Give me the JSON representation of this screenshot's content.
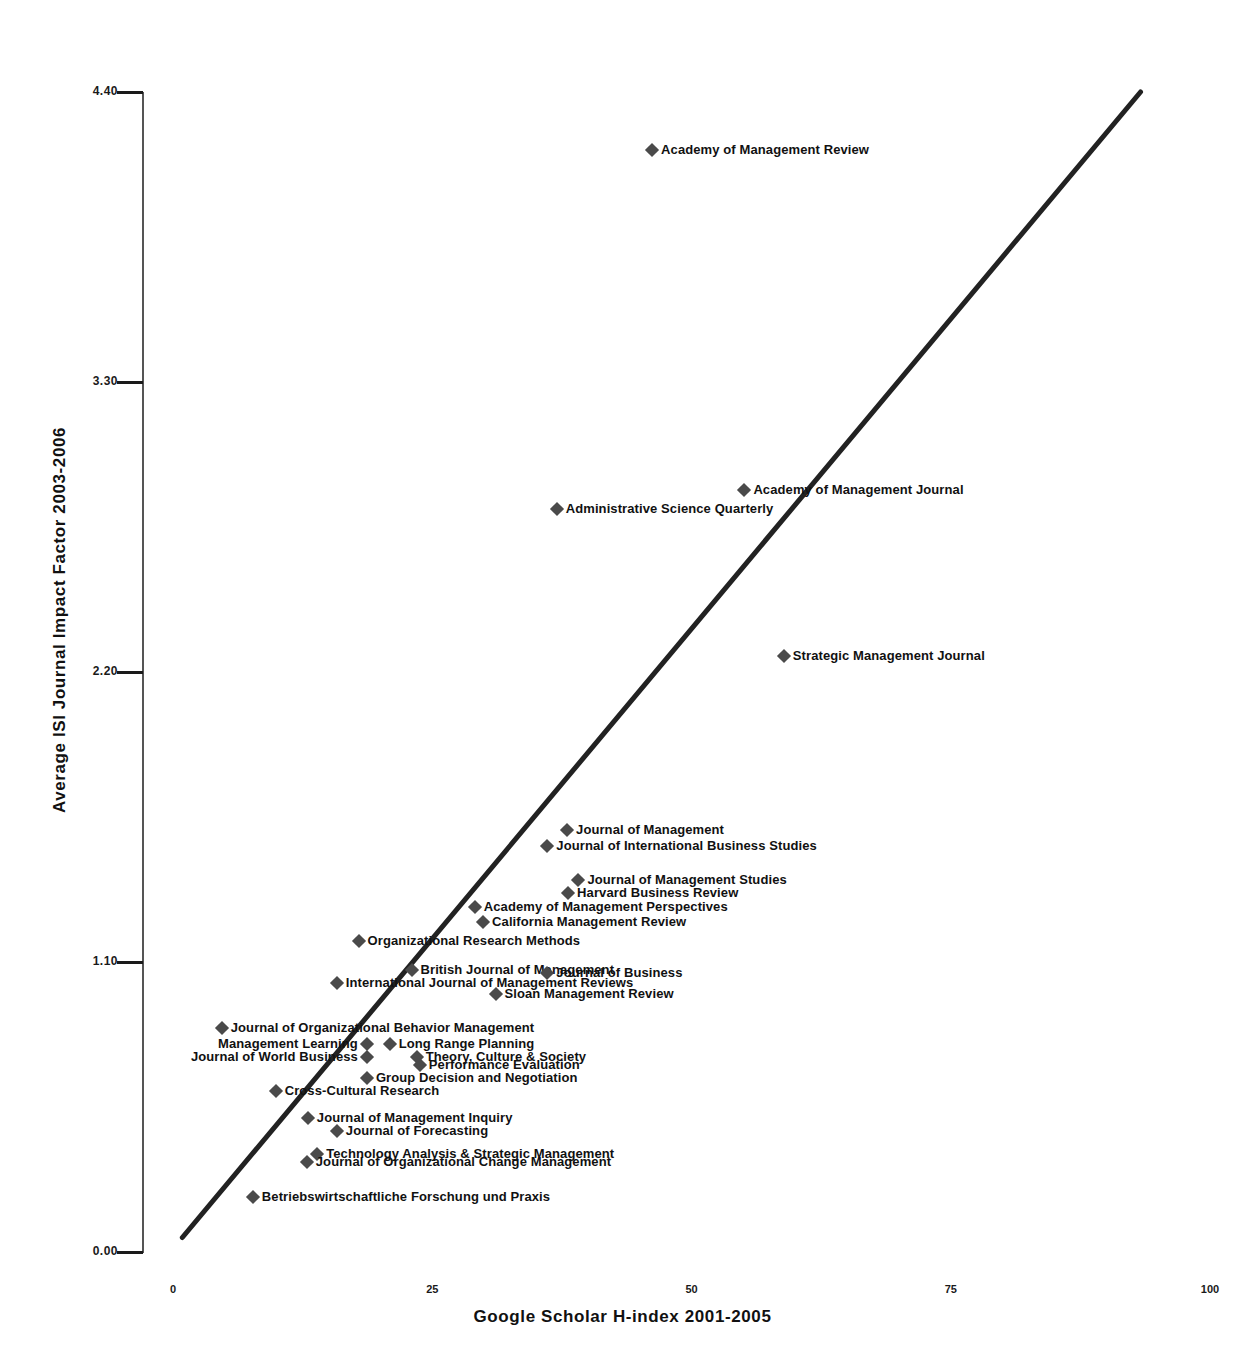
{
  "chart_data": {
    "type": "scatter",
    "title": "",
    "xlabel": "Google Scholar H-index 2001-2005",
    "ylabel": "Average ISI Journal Impact Factor 2003-2006",
    "xlim": [
      0,
      100
    ],
    "ylim": [
      0.0,
      4.4
    ],
    "xticks": [
      "0",
      "25",
      "50",
      "75",
      "100"
    ],
    "xtick_values": [
      0,
      25,
      50,
      75,
      100
    ],
    "yticks": [
      "0.00",
      "1.10",
      "2.20",
      "3.30",
      "4.40"
    ],
    "ytick_values": [
      0.0,
      1.1,
      2.2,
      3.3,
      4.4
    ],
    "grid": false,
    "legend": "none",
    "marker": "diamond",
    "marker_color": "#4a4a4a",
    "trendline": {
      "visible": true,
      "color": "#222222",
      "x_start": 0.9,
      "y_start": 0.055,
      "x_end": 93.3,
      "y_end": 4.4
    },
    "points": [
      {
        "label": "Academy of Management Review",
        "x": 46.2,
        "y": 4.18,
        "label_side": "right"
      },
      {
        "label": "Academy of Management Journal",
        "x": 55.1,
        "y": 2.89,
        "label_side": "right"
      },
      {
        "label": "Administrative Science Quarterly",
        "x": 37.0,
        "y": 2.82,
        "label_side": "right"
      },
      {
        "label": "Strategic Management Journal",
        "x": 58.9,
        "y": 2.26,
        "label_side": "right"
      },
      {
        "label": "Journal of Management",
        "x": 38.0,
        "y": 1.6,
        "label_side": "right"
      },
      {
        "label": "Journal of International Business Studies",
        "x": 36.1,
        "y": 1.54,
        "label_side": "right"
      },
      {
        "label": "Journal of Management Studies",
        "x": 39.1,
        "y": 1.41,
        "label_side": "right"
      },
      {
        "label": "Harvard Business Review",
        "x": 38.1,
        "y": 1.36,
        "label_side": "right"
      },
      {
        "label": "Academy of Management Perspectives",
        "x": 29.1,
        "y": 1.31,
        "label_side": "right"
      },
      {
        "label": "California Management Review",
        "x": 29.9,
        "y": 1.25,
        "label_side": "right"
      },
      {
        "label": "Organizational Research Methods",
        "x": 17.9,
        "y": 1.18,
        "label_side": "right"
      },
      {
        "label": "British Journal of Management",
        "x": 23.0,
        "y": 1.07,
        "label_side": "right"
      },
      {
        "label": "Journal of Business",
        "x": 36.1,
        "y": 1.06,
        "label_side": "right"
      },
      {
        "label": "International Journal of Management Reviews",
        "x": 15.8,
        "y": 1.02,
        "label_side": "right"
      },
      {
        "label": "Sloan Management Review",
        "x": 31.1,
        "y": 0.98,
        "label_side": "right"
      },
      {
        "label": "Journal of Organizational Behavior Management",
        "x": 4.7,
        "y": 0.85,
        "label_side": "right"
      },
      {
        "label": "Management Learning",
        "x": 18.7,
        "y": 0.79,
        "label_side": "left"
      },
      {
        "label": "Long Range Planning",
        "x": 20.9,
        "y": 0.79,
        "label_side": "right"
      },
      {
        "label": "Journal of World Business",
        "x": 18.7,
        "y": 0.74,
        "label_side": "left"
      },
      {
        "label": "Theory, Culture &  Society",
        "x": 23.5,
        "y": 0.74,
        "label_side": "right"
      },
      {
        "label": "Performance Evaluation",
        "x": 23.8,
        "y": 0.71,
        "label_side": "right"
      },
      {
        "label": "Group Decision and Negotiation",
        "x": 18.7,
        "y": 0.66,
        "label_side": "right"
      },
      {
        "label": "Cross-Cultural Research",
        "x": 9.9,
        "y": 0.61,
        "label_side": "right"
      },
      {
        "label": "Journal of Management Inquiry",
        "x": 13.0,
        "y": 0.51,
        "label_side": "right"
      },
      {
        "label": "Journal of Forecasting",
        "x": 15.8,
        "y": 0.46,
        "label_side": "right"
      },
      {
        "label": "Technology Analysis & Strategic Management",
        "x": 13.9,
        "y": 0.37,
        "label_side": "right"
      },
      {
        "label": "Journal of Organizational Change Management",
        "x": 12.9,
        "y": 0.34,
        "label_side": "right"
      },
      {
        "label": "Betriebswirtschaftliche Forschung und Praxis",
        "x": 7.7,
        "y": 0.21,
        "label_side": "right"
      }
    ]
  }
}
